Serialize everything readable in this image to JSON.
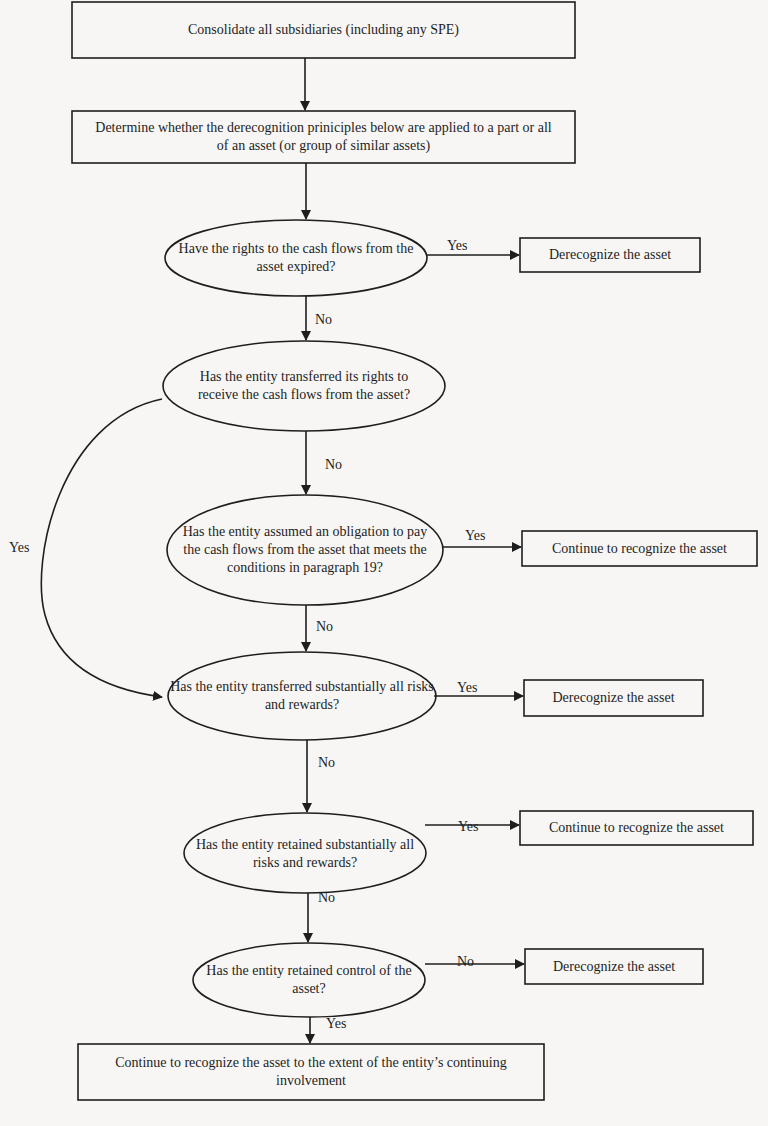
{
  "diagram": {
    "type": "flowchart",
    "line_color": "#1e1e1e",
    "background": "#f7f6f4",
    "nodes": {
      "consolidate": {
        "shape": "rect",
        "text": "Consolidate all subsidiaries (including any SPE)"
      },
      "determine": {
        "shape": "rect",
        "text": "Determine whether the derecognition priniciples below are applied to a part or all of an asset (or group of similar assets)"
      },
      "q_rights_expired": {
        "shape": "ellipse",
        "text": "Have the rights to the cash flows from the asset expired?"
      },
      "r_derecognize_1": {
        "shape": "rect",
        "text": "Derecognize the asset"
      },
      "q_transferred_rights": {
        "shape": "ellipse",
        "text": "Has the entity transferred its rights to receive the cash flows from the asset?"
      },
      "q_assumed_obligation": {
        "shape": "ellipse",
        "text": "Has the entity assumed an obligation to pay the cash flows from the asset that meets the conditions in paragraph 19?"
      },
      "r_continue_1": {
        "shape": "rect",
        "text": "Continue to recognize the asset"
      },
      "q_transferred_risks": {
        "shape": "ellipse",
        "text": "Has the entity transferred substantially all risks and rewards?"
      },
      "r_derecognize_2": {
        "shape": "rect",
        "text": "Derecognize the asset"
      },
      "q_retained_risks": {
        "shape": "ellipse",
        "text": "Has the entity retained substantially all risks and rewards?"
      },
      "r_continue_2": {
        "shape": "rect",
        "text": "Continue to recognize the asset"
      },
      "q_retained_control": {
        "shape": "ellipse",
        "text": "Has the entity retained control of the asset?"
      },
      "r_derecognize_3": {
        "shape": "rect",
        "text": "Derecognize the asset"
      },
      "r_continuing_involvement": {
        "shape": "rect",
        "text": "Continue to recognize the asset to the extent of the entity’s continuing involvement"
      }
    },
    "edges": {
      "e1": {
        "from": "consolidate",
        "to": "determine",
        "label": ""
      },
      "e2": {
        "from": "determine",
        "to": "q_rights_expired",
        "label": ""
      },
      "e3": {
        "from": "q_rights_expired",
        "to": "r_derecognize_1",
        "label": "Yes"
      },
      "e4": {
        "from": "q_rights_expired",
        "to": "q_transferred_rights",
        "label": "No"
      },
      "e5": {
        "from": "q_transferred_rights",
        "to": "q_assumed_obligation",
        "label": "No"
      },
      "e6": {
        "from": "q_transferred_rights",
        "to": "q_transferred_risks",
        "label": "Yes"
      },
      "e7": {
        "from": "q_assumed_obligation",
        "to": "r_continue_1",
        "label": "Yes"
      },
      "e8": {
        "from": "q_assumed_obligation",
        "to": "q_transferred_risks",
        "label": "No"
      },
      "e9": {
        "from": "q_transferred_risks",
        "to": "r_derecognize_2",
        "label": "Yes"
      },
      "e10": {
        "from": "q_transferred_risks",
        "to": "q_retained_risks",
        "label": "No"
      },
      "e11": {
        "from": "q_retained_risks",
        "to": "r_continue_2",
        "label": "Yes"
      },
      "e12": {
        "from": "q_retained_risks",
        "to": "q_retained_control",
        "label": "No"
      },
      "e13": {
        "from": "q_retained_control",
        "to": "r_derecognize_3",
        "label": "No"
      },
      "e14": {
        "from": "q_retained_control",
        "to": "r_continuing_involvement",
        "label": "Yes"
      }
    }
  }
}
